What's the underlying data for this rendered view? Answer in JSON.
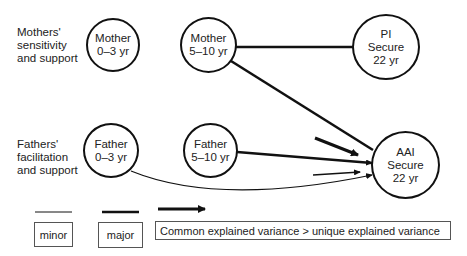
{
  "row_labels": {
    "mothers": [
      "Mothers'",
      "sensitivity",
      "and support"
    ],
    "fathers": [
      "Fathers'",
      "facilitation",
      "and support"
    ]
  },
  "nodes": {
    "mother_0_3": {
      "line1": "Mother",
      "line2": "0–3 yr"
    },
    "mother_5_10": {
      "line1": "Mother",
      "line2": "5–10 yr"
    },
    "pi_secure": {
      "line1": "PI",
      "line2": "Secure",
      "line3": "22 yr"
    },
    "father_0_3": {
      "line1": "Father",
      "line2": "0–3 yr"
    },
    "father_5_10": {
      "line1": "Father",
      "line2": "5–10 yr"
    },
    "aai_secure": {
      "line1": "AAI",
      "line2": "Secure",
      "line3": "22 yr"
    }
  },
  "edges": [
    {
      "from": "Mother 5–10 yr",
      "to": "PI Secure 22 yr",
      "weight": "major"
    },
    {
      "from": "Mother 5–10 yr",
      "to": "AAI Secure 22 yr",
      "weight": "major"
    },
    {
      "from": "Father 5–10 yr",
      "to": "AAI Secure 22 yr",
      "weight": "major"
    },
    {
      "from": "Father 0–3 yr",
      "to": "AAI Secure 22 yr",
      "weight": "minor"
    },
    {
      "from": "common (thick arrow)",
      "to": "AAI Secure 22 yr",
      "weight": "common > unique"
    },
    {
      "from": "common (thin arrow)",
      "to": "AAI Secure 22 yr",
      "weight": "minor"
    }
  ],
  "legend": {
    "minor": "minor",
    "major": "major",
    "arrow": "Common explained variance > unique explained variance"
  },
  "colors": {
    "stroke": "#111111",
    "background": "#ffffff"
  }
}
